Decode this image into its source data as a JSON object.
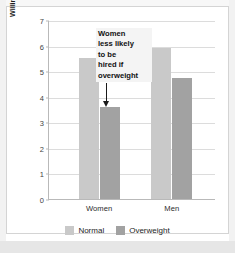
{
  "chart_data": {
    "type": "bar",
    "title": "",
    "subtitle": "",
    "xlabel": "",
    "ylabel": "Willingness to hire scale (from 1: definitely\nnot hire, to 7: definitely hire)",
    "categories": [
      "Women",
      "Men"
    ],
    "series": [
      {
        "name": "Normal",
        "values": [
          5.5,
          5.9
        ],
        "color": "#c9c9c9"
      },
      {
        "name": "Overweight",
        "values": [
          3.6,
          4.75
        ],
        "color": "#a2a2a2"
      }
    ],
    "ylim": [
      0,
      7
    ],
    "yticks": [
      0,
      1,
      2,
      3,
      4,
      5,
      6,
      7
    ],
    "ytick_labels": [
      "0",
      "1",
      "2",
      "3",
      "4",
      "5",
      "6",
      "7"
    ],
    "grid": true,
    "legend_position": "bottom",
    "annotations": [
      {
        "text": "Women\nless likely\nto be\nhired if\noverweight",
        "points_to": "Women / Overweight bar",
        "arrow": "down"
      }
    ]
  },
  "legend": {
    "items": [
      {
        "label": "Normal",
        "color": "#c9c9c9"
      },
      {
        "label": "Overweight",
        "color": "#a2a2a2"
      }
    ]
  },
  "axis": {
    "y_title": "Willingness to hire scale (from 1: definitely\nnot hire, to 7: definitely hire)",
    "y_ticks": [
      "7",
      "6",
      "5",
      "4",
      "3",
      "2",
      "1",
      "0"
    ],
    "x_ticks": [
      "Women",
      "Men"
    ]
  },
  "annotation": {
    "text": "Women\nless likely\nto be\nhired if\noverweight"
  },
  "colors": {
    "normal": "#c9c9c9",
    "overweight": "#a2a2a2",
    "grid": "#dcdcdc",
    "axis": "#b9b9b9",
    "frame": "#d4d4d4"
  }
}
